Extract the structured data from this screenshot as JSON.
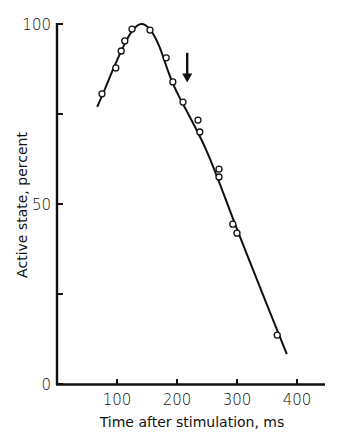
{
  "chart_data": {
    "type": "line",
    "title": "",
    "xlabel": "Time after stimulation, ms",
    "ylabel": "Active state, percent",
    "xlim": [
      0,
      450
    ],
    "ylim": [
      0,
      100
    ],
    "x_ticks": [
      100,
      200,
      300,
      400
    ],
    "x_tick_labels": [
      "100",
      "200",
      "300",
      "400"
    ],
    "y_ticks": [
      0,
      25,
      50,
      75,
      100
    ],
    "y_tick_labels": [
      "0",
      "",
      "50",
      "",
      "100"
    ],
    "grid": false,
    "legend": null,
    "series": [
      {
        "name": "Measured active state",
        "style": "open-circle markers",
        "x": [
          75,
          98,
          107,
          113,
          125,
          155,
          182,
          193,
          210,
          235,
          238,
          270,
          270,
          293,
          300,
          367
        ],
        "y": [
          80.6,
          87.8,
          92.5,
          95.3,
          98.6,
          98.3,
          90.6,
          83.9,
          78.3,
          73.3,
          70.0,
          59.7,
          57.5,
          44.4,
          41.9,
          13.6
        ]
      },
      {
        "name": "Fitted curve",
        "style": "solid line",
        "x": [
          67,
          80,
          95,
          110,
          125,
          140,
          155,
          170,
          185,
          200,
          250,
          300,
          350,
          383
        ],
        "y": [
          77,
          82,
          88,
          93.5,
          98,
          100,
          98.5,
          94,
          87,
          81,
          64.5,
          43,
          22,
          8.3
        ]
      }
    ],
    "annotations": [
      {
        "type": "arrow",
        "direction": "down",
        "x": 217,
        "y_from": 92,
        "y_to": 84
      }
    ]
  },
  "axes": {
    "x_title": "Time after stimulation, ms",
    "y_title": "Active state, percent",
    "x_ticks": [
      "100",
      "200",
      "300",
      "400"
    ],
    "y_ticks": [
      "0",
      "50",
      "100"
    ]
  }
}
